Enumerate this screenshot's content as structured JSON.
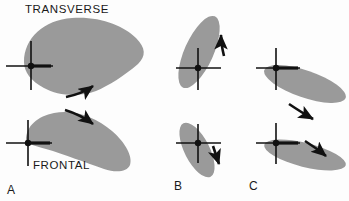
{
  "figure": {
    "caption_labels": {
      "transverse": "TRANSVERSE",
      "frontal": "FRONTAL"
    },
    "colors": {
      "shape_fill": "#9a9a9a",
      "ink": "#111111",
      "background": "#fdfdfd"
    }
  },
  "panels": [
    {
      "letter": "A",
      "views": [
        {
          "name": "transverse",
          "shape": "teardrop-wide",
          "arrow_direction": "up-right",
          "arrow_position": "below-shape"
        },
        {
          "name": "frontal",
          "shape": "crescent-wide",
          "arrow_direction": "down-right",
          "arrow_position": "above-shape"
        }
      ]
    },
    {
      "letter": "B",
      "views": [
        {
          "name": "transverse",
          "shape": "ellipse-steep-up-right",
          "arrow_direction": "up",
          "arrow_position": "right-of-shape"
        },
        {
          "name": "frontal",
          "shape": "ellipse-steep-down-right",
          "arrow_direction": "down",
          "arrow_position": "right-of-shape"
        }
      ]
    },
    {
      "letter": "C",
      "views": [
        {
          "name": "transverse",
          "shape": "ellipse-shallow-down-right",
          "arrow_direction": "down-right",
          "arrow_position": "below-shape"
        },
        {
          "name": "frontal",
          "shape": "ellipse-shallow-down-right",
          "arrow_direction": "down-right",
          "arrow_position": "above-shape"
        }
      ]
    }
  ]
}
